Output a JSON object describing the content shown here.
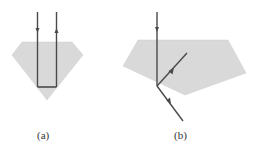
{
  "diagram": {
    "colors": {
      "fill": "#d9d9d9",
      "stroke": "#4a4a4a",
      "label": "#333333"
    },
    "panels": [
      {
        "id": "a",
        "label": "(a)",
        "shape": "diamond",
        "description": "Light ray enters diamond vertically, totally internally reflects at bottom, exits vertically upward"
      },
      {
        "id": "b",
        "label": "(b)",
        "shape": "pentagon",
        "description": "Light ray enters pentagon vertically, refracts out at lower-left face; a second ray reflects inward toward upper right"
      }
    ]
  }
}
